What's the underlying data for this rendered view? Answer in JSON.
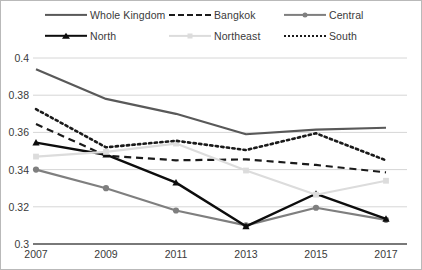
{
  "chart_data": {
    "type": "line",
    "title": "",
    "xlabel": "",
    "ylabel": "",
    "x": [
      2007,
      2009,
      2011,
      2013,
      2015,
      2017
    ],
    "categories": [
      "2007",
      "2009",
      "2011",
      "2013",
      "2015",
      "2017"
    ],
    "xtick_labels": [
      "2007",
      "2009",
      "2011",
      "2013",
      "2015",
      "2017"
    ],
    "ytick_labels": [
      "0.4",
      "0.38",
      "0.36",
      "0.34",
      "0.32",
      "0.3"
    ],
    "yticks": [
      0.4,
      0.38,
      0.36,
      0.34,
      0.32,
      0.3
    ],
    "ylim": [
      0.3,
      0.4
    ],
    "xlim": [
      2007,
      2017
    ],
    "grid": true,
    "grid_axis": "y",
    "legend_position": "top",
    "legend_columns": 3,
    "series": [
      {
        "name": "Whole Kingdom",
        "values": [
          0.394,
          0.378,
          0.37,
          0.359,
          0.3615,
          0.3625
        ],
        "color": "#595959",
        "style": "solid",
        "marker": "none",
        "width": 2.2
      },
      {
        "name": "Bangkok",
        "values": [
          0.3645,
          0.3475,
          0.345,
          0.3455,
          0.3425,
          0.3385
        ],
        "color": "#1a1a1a",
        "style": "dashed",
        "marker": "none",
        "width": 2.2
      },
      {
        "name": "Central",
        "values": [
          0.34,
          0.33,
          0.318,
          0.31,
          0.3195,
          0.313
        ],
        "color": "#7f7f7f",
        "style": "solid",
        "marker": "circle",
        "width": 2.2
      },
      {
        "name": "North",
        "values": [
          0.3545,
          0.348,
          0.333,
          0.3095,
          0.327,
          0.3135
        ],
        "color": "#0d0d0d",
        "style": "solid",
        "marker": "triangle",
        "width": 2.4
      },
      {
        "name": "Northeast",
        "values": [
          0.347,
          0.3495,
          0.354,
          0.3395,
          0.3265,
          0.334
        ],
        "color": "#dcdcdc",
        "style": "solid",
        "marker": "square",
        "width": 2.2
      },
      {
        "name": "South",
        "values": [
          0.3725,
          0.352,
          0.3555,
          0.3505,
          0.3595,
          0.345
        ],
        "color": "#1a1a1a",
        "style": "dotted",
        "marker": "none",
        "width": 2.6
      }
    ]
  },
  "legend": {
    "items": [
      {
        "label": "Whole Kingdom",
        "key": "solid-dark-line-key"
      },
      {
        "label": "Bangkok",
        "key": "dashed-line-key"
      },
      {
        "label": "Central",
        "key": "solid-mid-circle-key"
      },
      {
        "label": "North",
        "key": "solid-black-triangle-key"
      },
      {
        "label": "Northeast",
        "key": "solid-light-square-key"
      },
      {
        "label": "South",
        "key": "dotted-line-key"
      }
    ]
  },
  "axes": {
    "y_labels": [
      "0.4",
      "0.38",
      "0.36",
      "0.34",
      "0.32",
      "0.3"
    ],
    "x_labels": [
      "2007",
      "2009",
      "2011",
      "2013",
      "2015",
      "2017"
    ]
  }
}
